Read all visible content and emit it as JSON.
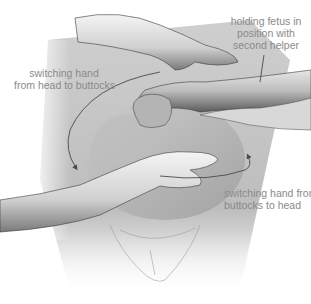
{
  "figure": {
    "colors": {
      "background": "#ffffff",
      "skin_light": "#f2f2f2",
      "skin_mid": "#c8c8c8",
      "skin_dark": "#6a6a6a",
      "label_text": "#8a8a8a",
      "arrow": "#4a4a4a"
    }
  },
  "labels": {
    "top_right": {
      "line1": "holding fetus in",
      "line2": "position with",
      "line3": "second helper"
    },
    "left": {
      "line1": "switching hand",
      "line2": "from head to buttocks"
    },
    "right": {
      "line1": "switching hand from",
      "line2": "buttocks to head"
    }
  },
  "icons": {
    "arrow_left": "curved-arrow-down-left",
    "arrow_right": "curved-arrow-up-right"
  }
}
